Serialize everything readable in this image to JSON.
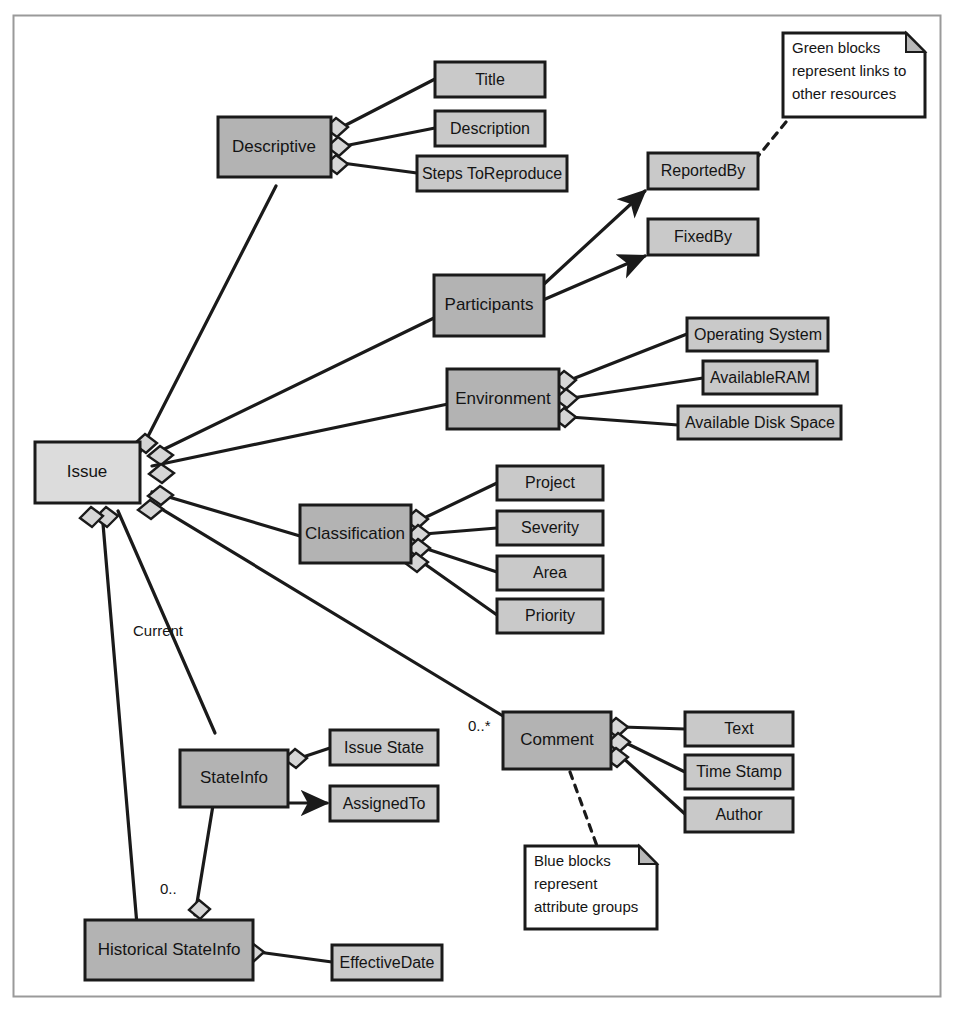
{
  "diagram": {
    "type": "uml-class-composition",
    "colors": {
      "group_block_fill": "#b3b3b3",
      "link_block_fill": "#c9c9c9",
      "root_block_fill": "#dcdcdc",
      "stroke": "#1a1a1a",
      "note_fill": "#ffffff",
      "background": "#ffffff"
    },
    "root": {
      "label": "Issue",
      "kind": "root-block"
    },
    "groups": [
      {
        "id": "descriptive",
        "label": "Descriptive",
        "kind": "attribute-group"
      },
      {
        "id": "participants",
        "label": "Participants",
        "kind": "attribute-group"
      },
      {
        "id": "environment",
        "label": "Environment",
        "kind": "attribute-group"
      },
      {
        "id": "classification",
        "label": "Classification",
        "kind": "attribute-group"
      },
      {
        "id": "stateinfo",
        "label": "StateInfo",
        "kind": "attribute-group"
      },
      {
        "id": "comment",
        "label": "Comment",
        "kind": "attribute-group"
      },
      {
        "id": "historical",
        "label": "Historical StateInfo",
        "kind": "attribute-group"
      }
    ],
    "attributes": {
      "descriptive": [
        "Title",
        "Description",
        "Steps ToReproduce"
      ],
      "participants": [
        "ReportedBy",
        "FixedBy"
      ],
      "environment": [
        "Operating System",
        "AvailableRAM",
        "Available Disk Space"
      ],
      "classification": [
        "Project",
        "Severity",
        "Area",
        "Priority"
      ],
      "stateinfo": [
        "Issue State",
        "AssignedTo"
      ],
      "comment": [
        "Text",
        "Time Stamp",
        "Author"
      ],
      "historical": [
        "EffectiveDate"
      ]
    },
    "links": [
      {
        "label": "ReportedBy",
        "kind": "link-block"
      },
      {
        "label": "FixedBy",
        "kind": "link-block"
      },
      {
        "label": "AssignedTo",
        "kind": "link-block"
      }
    ],
    "multiplicities": [
      {
        "id": "current",
        "text": "Current",
        "from": "Issue",
        "to": "StateInfo"
      },
      {
        "id": "zeromany",
        "text": "0..*",
        "from": "Issue",
        "to": "Comment"
      },
      {
        "id": "zerodot",
        "text": "0..",
        "from": "Issue",
        "to": "Historical StateInfo"
      }
    ],
    "notes": [
      {
        "id": "note-green",
        "lines": [
          "Green blocks",
          "represent links to",
          "other resources"
        ],
        "attached_to": "ReportedBy"
      },
      {
        "id": "note-blue",
        "lines": [
          "Blue blocks",
          "represent",
          "attribute groups"
        ],
        "attached_to": "Comment"
      }
    ]
  }
}
